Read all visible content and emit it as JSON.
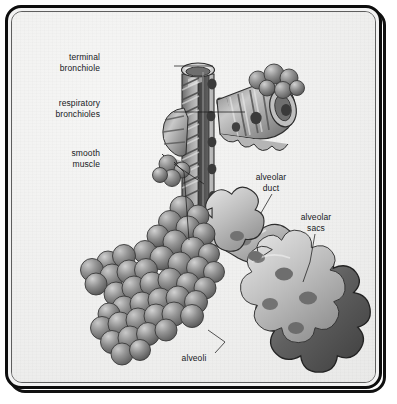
{
  "figure": {
    "background_color": "#f1f1f0",
    "frame_color": "#0d0d0d",
    "ink_color": "#16181c",
    "tissue_light": "#d6d6d6",
    "tissue_mid": "#9a9a9a",
    "tissue_dark": "#5a5a5a",
    "lumen_dark": "#4a4a4a"
  },
  "labels": [
    {
      "id": "terminal-bronchiole",
      "text": "terminal\nbronchiole",
      "align": "right",
      "x": 88,
      "y": 44,
      "width": 72
    },
    {
      "id": "respiratory-bronchioles",
      "text": "respiratory\nbronchioles",
      "align": "right",
      "x": 78,
      "y": 90,
      "width": 82
    },
    {
      "id": "smooth-muscle",
      "text": "smooth\nmuscle",
      "align": "right",
      "x": 95,
      "y": 140,
      "width": 65
    },
    {
      "id": "alveolar-duct",
      "text": "alveolar\nduct",
      "align": "center",
      "x": 243,
      "y": 164,
      "width": 56
    },
    {
      "id": "alveolar-sacs",
      "text": "alveolar\nsacs",
      "align": "center",
      "x": 288,
      "y": 204,
      "width": 56
    },
    {
      "id": "alveoli",
      "text": "alveoli",
      "align": "center",
      "x": 182,
      "y": 345,
      "width": 48
    }
  ],
  "leaders": [
    {
      "id": "leader-terminal-bronchiole",
      "points": "162,54 201,54"
    },
    {
      "id": "leader-respiratory-bronchioles",
      "points": "162,100 233,100"
    },
    {
      "id": "leader-smooth-muscle-a",
      "points": "162,150 170,158 176,228"
    },
    {
      "id": "leader-smooth-muscle-b",
      "points": "162,152 190,170"
    },
    {
      "id": "leader-alveolar-duct",
      "points": "260,182 248,200"
    },
    {
      "id": "leader-alveolar-sacs",
      "points": "303,222 298,248 292,268"
    },
    {
      "id": "leader-alveoli",
      "points": "203,341 212,330 196,318"
    }
  ],
  "structures": [
    {
      "id": "terminal-bronchiole-tube",
      "kind": "ringed-tube",
      "orientation": "vertical"
    },
    {
      "id": "respiratory-bronchiole-right",
      "kind": "ringed-tube",
      "orientation": "diagonal-right"
    },
    {
      "id": "respiratory-bronchiole-left",
      "kind": "ringed-tube",
      "orientation": "diagonal-left"
    },
    {
      "id": "alveolar-duct-passage",
      "kind": "scalloped-duct"
    },
    {
      "id": "alveolar-sac-cluster-right",
      "kind": "cutaway-lobed-sac"
    },
    {
      "id": "alveoli-grape-cluster-left",
      "kind": "sphere-cluster"
    }
  ]
}
